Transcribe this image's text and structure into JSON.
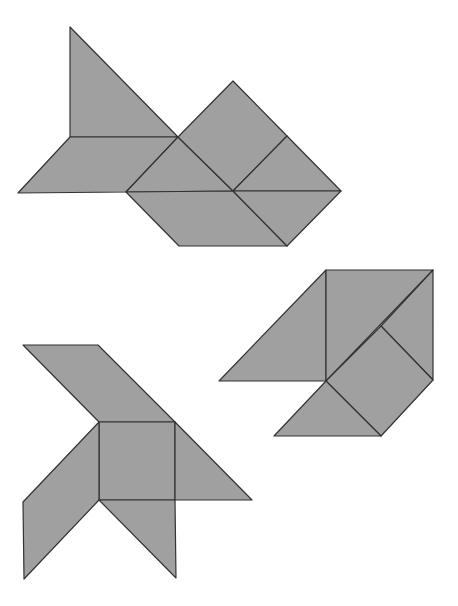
{
  "fill_color": "#a0a0a0",
  "stroke_color": "#333333",
  "figures": [
    {
      "name": "figure-top",
      "pieces": [
        {
          "shape": "large-triangle",
          "points": "70,27 70,137 178,137"
        },
        {
          "shape": "parallelogram",
          "points": "70,137 178,137 126,192 18,193"
        },
        {
          "shape": "small-triangle",
          "points": "178,137 233,191 126,192"
        },
        {
          "shape": "square",
          "points": "233,81 287,136 233,191 178,137"
        },
        {
          "shape": "medium-triangle",
          "points": "287,136 341,191 233,191"
        },
        {
          "shape": "parallelogram-2",
          "points": "126,192 233,191 287,246 179,246"
        },
        {
          "shape": "triangle-2",
          "points": "233,191 341,191 287,246"
        }
      ]
    },
    {
      "name": "figure-right",
      "pieces": [
        {
          "shape": "triangle-left",
          "points": "326,270 326,381 219,381"
        },
        {
          "shape": "large-triangle",
          "points": "326,270 433,270 326,381"
        },
        {
          "shape": "small-triangle-top",
          "points": "433,270 433,380 381,326"
        },
        {
          "shape": "square",
          "points": "381,326 433,380 381,436 326,381"
        },
        {
          "shape": "bottom-triangle",
          "points": "326,381 381,436 274,436"
        }
      ]
    },
    {
      "name": "figure-bottom-left",
      "pieces": [
        {
          "shape": "parallelogram-top",
          "points": "23,345 98,345 175,422 99,422"
        },
        {
          "shape": "square",
          "points": "99,422 175,422 175,500 99,500"
        },
        {
          "shape": "triangle-right",
          "points": "175,422 252,500 175,500"
        },
        {
          "shape": "parallelogram-left",
          "points": "99,422 99,500 24,579 23,502"
        },
        {
          "shape": "triangle-bottom",
          "points": "99,500 175,500 176,578"
        }
      ]
    }
  ]
}
